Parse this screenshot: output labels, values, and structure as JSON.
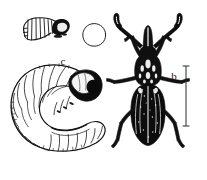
{
  "figure": {
    "name": "beetle-life-cycle-illustration",
    "background_color": "#ffffff",
    "ink_color": "#111111",
    "width": 207,
    "height": 180,
    "style": "black-and-white scientific line drawing / stipple engraving"
  },
  "stages": [
    {
      "key": "adult",
      "label": "a",
      "subject": "adult weevil beetle, dorsal view",
      "features": "elongate dark elytra, long elbowed clubbed antennae forming a wide V, rostrum snout, three pairs of legs"
    },
    {
      "key": "egg",
      "label": "b",
      "subject": "egg",
      "features": "plain oval outline, unshaded"
    },
    {
      "key": "pupa",
      "label": "c",
      "subject": "pupa",
      "features": "small curved segmented body with dark head capsule"
    },
    {
      "key": "larva",
      "label": "d",
      "subject": "larva / grub",
      "features": "C-shaped legless grub, strongly segmented body, dark head capsule with eye spot"
    }
  ],
  "scale_bar": {
    "name": "scale-bar",
    "orientation": "vertical",
    "caption": "",
    "description": "vertical line with short horizontal serifs at top and bottom, placed right of the adult beetle"
  }
}
